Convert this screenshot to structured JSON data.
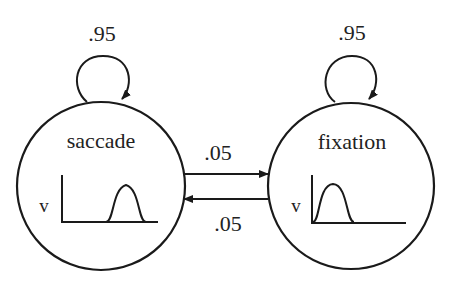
{
  "diagram": {
    "type": "state-transition",
    "states": [
      {
        "id": "saccade",
        "label": "saccade",
        "self_transition": ".95",
        "axis_label": "v",
        "velocity_profile": "late-peak"
      },
      {
        "id": "fixation",
        "label": "fixation",
        "self_transition": ".95",
        "axis_label": "v",
        "velocity_profile": "early-peak"
      }
    ],
    "transitions": [
      {
        "from": "saccade",
        "to": "fixation",
        "label": ".05"
      },
      {
        "from": "fixation",
        "to": "saccade",
        "label": ".05"
      }
    ]
  },
  "colors": {
    "stroke": "#1a1a1a",
    "background": "#ffffff"
  }
}
